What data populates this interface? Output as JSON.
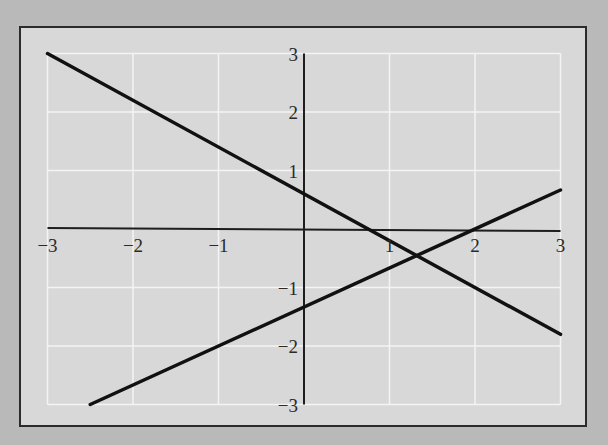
{
  "colors": {
    "page_background": "#b9b9b9",
    "plot_background": "#d8d8d8",
    "frame": "#2b2b2b",
    "grid": "#f4f4f4",
    "axis": "#1e1e1e",
    "line": "#111111"
  },
  "chart_data": {
    "type": "line",
    "title": "",
    "xlabel": "",
    "ylabel": "",
    "xlim": [
      -3,
      3
    ],
    "ylim": [
      -3,
      3
    ],
    "grid": true,
    "legend": null,
    "x_ticks": [
      -3,
      -2,
      -1,
      1,
      2,
      3
    ],
    "y_ticks": [
      3,
      2,
      1,
      -1,
      -2,
      -3
    ],
    "x_tick_labels": [
      "−3",
      "−2",
      "−1",
      "1",
      "2",
      "3"
    ],
    "y_tick_labels": [
      "3",
      "2",
      "1",
      "−1",
      "−2",
      "−3"
    ],
    "series": [
      {
        "name": "line-1",
        "equation": "y = -0.8x + 0.6",
        "x": [
          -3,
          3
        ],
        "y": [
          3.0,
          -1.8
        ]
      },
      {
        "name": "line-2",
        "equation": "y = (2/3)x - 4/3",
        "x": [
          -2.5,
          3
        ],
        "y": [
          -3.0,
          0.667
        ]
      }
    ],
    "annotations": [
      {
        "label": "intersection",
        "x": 1.32,
        "y": -0.45
      }
    ]
  }
}
